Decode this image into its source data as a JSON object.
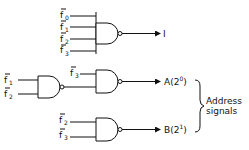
{
  "diagram": {
    "type": "logic-circuit",
    "top_gate": {
      "gate": "NAND",
      "inputs": [
        {
          "name": "f",
          "sub": "0",
          "negated": true
        },
        {
          "name": "f",
          "sub": "1",
          "negated": true
        },
        {
          "name": "f",
          "sub": "2",
          "negated": true
        },
        {
          "name": "f",
          "sub": "3",
          "negated": true
        }
      ],
      "output_label": "I"
    },
    "address_a": {
      "first_gate": {
        "gate": "NAND",
        "inputs": [
          {
            "name": "f",
            "sub": "1",
            "negated": true
          },
          {
            "name": "f",
            "sub": "2",
            "negated": true
          }
        ]
      },
      "second_gate": {
        "gate": "NAND",
        "inputs": [
          {
            "name": "f",
            "sub": "3",
            "negated": true
          },
          {
            "name": "first_gate_output"
          }
        ]
      },
      "output_label": "A(2",
      "output_exp": "0",
      "output_close": ")"
    },
    "address_b": {
      "gate": "NAND",
      "inputs": [
        {
          "name": "f",
          "sub": "2",
          "negated": true
        },
        {
          "name": "f",
          "sub": "3",
          "negated": true
        }
      ],
      "output_label": "B(2",
      "output_exp": "1",
      "output_close": ")"
    },
    "brace_label_line1": "Address",
    "brace_label_line2": "signals"
  }
}
